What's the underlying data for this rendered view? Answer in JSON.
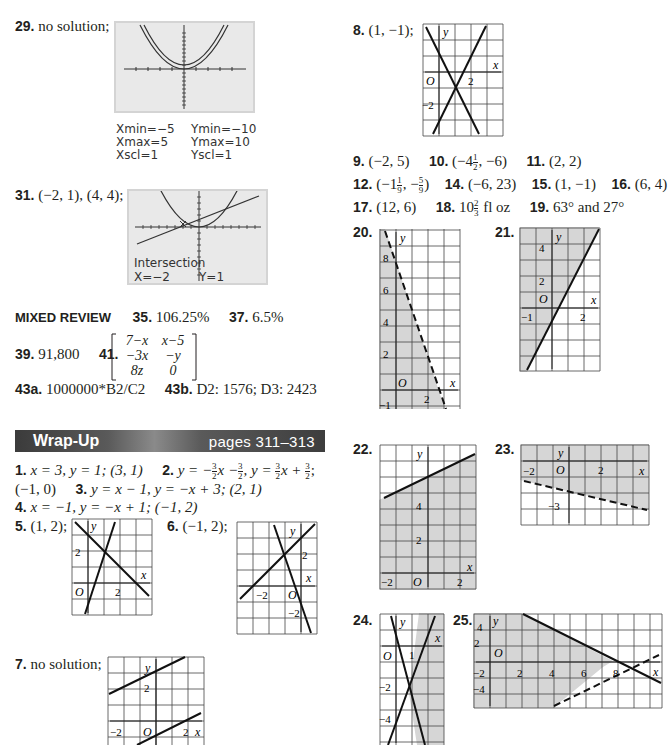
{
  "section_top": {
    "items": [
      {
        "num": "29.",
        "answer": "no solution;"
      },
      {
        "num": "31.",
        "answer": "(−2, 1), (4, 4);"
      }
    ],
    "calc29": {
      "window": {
        "xmin": "Xmin=−5",
        "xmax": "Xmax=5",
        "xscl": "Xscl=1",
        "ymin": "Ymin=−10",
        "ymax": "Ymax=10",
        "yscl": "Yscl=1"
      }
    },
    "calc31": {
      "label": "Intersection",
      "x_readout": "X=−2",
      "y_readout": "Y=1"
    }
  },
  "mixed_review": {
    "heading": "MIXED REVIEW",
    "items": [
      {
        "num": "35.",
        "answer": "106.25%"
      },
      {
        "num": "37.",
        "answer": "6.5%"
      },
      {
        "num": "39.",
        "answer": "91,800"
      },
      {
        "num": "41.",
        "answer": ""
      },
      {
        "num": "43a.",
        "answer": "1000000*B2/C2"
      },
      {
        "num": "43b.",
        "answer": "D2: 1576; D3: 2423"
      }
    ],
    "matrix41": [
      [
        "7−x",
        "x−5"
      ],
      [
        "−3x",
        "−y"
      ],
      [
        "8z",
        "0"
      ]
    ]
  },
  "wrap_up": {
    "title": "Wrap-Up",
    "pages": "pages 311–313",
    "items": [
      {
        "num": "1.",
        "answer": "x = 3, y = 1; (3, 1)"
      },
      {
        "num": "2.",
        "answer_a": "y = −",
        "answer_b": "x −",
        "answer_c": ", y = ",
        "answer_d": "x + ",
        "answer_e": ";",
        "frac": "3/2"
      },
      {
        "num": "",
        "answer": "(−1, 0)"
      },
      {
        "num": "3.",
        "answer": "y = x − 1, y = −x + 3; (2, 1)"
      },
      {
        "num": "4.",
        "answer": "x = −1, y = −x + 1; (−1, 2)"
      },
      {
        "num": "5.",
        "answer": "(1, 2);"
      },
      {
        "num": "6.",
        "answer": "(−1, 2);"
      },
      {
        "num": "7.",
        "answer": "no solution;"
      }
    ]
  },
  "right_column": {
    "items": [
      {
        "num": "8.",
        "answer": "(1, −1);"
      },
      {
        "num": "9.",
        "answer": "(−2, 5)"
      },
      {
        "num": "10.",
        "answer_a": "(−4",
        "frac": "1/2",
        "answer_b": ", −6)"
      },
      {
        "num": "11.",
        "answer": "(2, 2)"
      },
      {
        "num": "12.",
        "answer_a": "(−1",
        "frac1": "1/9",
        "answer_b": ", −",
        "frac2": "5/9",
        "answer_c": ")"
      },
      {
        "num": "14.",
        "answer": "(−6, 23)"
      },
      {
        "num": "15.",
        "answer": "(1, −1)"
      },
      {
        "num": "16.",
        "answer": "(6, 4)"
      },
      {
        "num": "17.",
        "answer": "(12, 6)"
      },
      {
        "num": "18.",
        "answer_a": "10",
        "frac": "2/3",
        "answer_b": " fl oz"
      },
      {
        "num": "19.",
        "answer": "63° and 27°"
      },
      {
        "num": "20.",
        "answer": ""
      },
      {
        "num": "21.",
        "answer": ""
      },
      {
        "num": "22.",
        "answer": ""
      },
      {
        "num": "23.",
        "answer": ""
      },
      {
        "num": "24.",
        "answer": ""
      },
      {
        "num": "25.",
        "answer": ""
      }
    ]
  },
  "graph_labels": {
    "y": "y",
    "x": "x",
    "o": "O",
    "two": "2",
    "neg_two": "−2",
    "four": "4",
    "neg_four": "−4",
    "six": "6",
    "eight": "8",
    "one": "1",
    "neg_one": "−1",
    "neg_three": "−3"
  },
  "colors": {
    "shade": "#d6d6d6",
    "grid": "#555555",
    "calc_bg": "#e9e9e9",
    "banner": "#4a4a4a",
    "text": "#231f20"
  }
}
